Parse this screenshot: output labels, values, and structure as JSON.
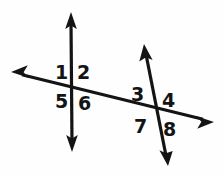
{
  "figure": {
    "name": "angle-pairs-two-transversals",
    "background_color": "#fefefe",
    "stroke_color": "#141414",
    "label_color": "#141414",
    "width": 223,
    "height": 175
  },
  "lines": [
    {
      "name": "vertical-line",
      "description": "vertical double-headed arrow line",
      "x1": 71,
      "y1": 12,
      "x2": 72,
      "y2": 152,
      "stroke_width": 3.2,
      "arrow_start": true,
      "arrow_end": true
    },
    {
      "name": "transversal-line",
      "description": "long shallow line from upper-left to lower-right",
      "x1": 11,
      "y1": 72,
      "x2": 214,
      "y2": 122,
      "stroke_width": 3.2,
      "arrow_start": true,
      "arrow_end": true
    },
    {
      "name": "slanted-line",
      "description": "steep line from upper-middle down to lower-right",
      "x1": 144,
      "y1": 44,
      "x2": 168,
      "y2": 166,
      "stroke_width": 3.2,
      "arrow_start": true,
      "arrow_end": true
    }
  ],
  "intersections": [
    {
      "name": "left-intersection",
      "x": 72,
      "y": 89
    },
    {
      "name": "right-intersection",
      "x": 156,
      "y": 112
    }
  ],
  "labels": [
    {
      "id": "1",
      "text": "1",
      "x": 55,
      "y": 63,
      "intersection": "left-intersection",
      "position": "upper-left"
    },
    {
      "id": "2",
      "text": "2",
      "x": 77,
      "y": 63,
      "intersection": "left-intersection",
      "position": "upper-right"
    },
    {
      "id": "3",
      "text": "3",
      "x": 131,
      "y": 85,
      "intersection": "right-intersection",
      "position": "upper-left"
    },
    {
      "id": "4",
      "text": "4",
      "x": 162,
      "y": 91,
      "intersection": "right-intersection",
      "position": "upper-right"
    },
    {
      "id": "5",
      "text": "5",
      "x": 55,
      "y": 92,
      "intersection": "left-intersection",
      "position": "lower-left"
    },
    {
      "id": "6",
      "text": "6",
      "x": 78,
      "y": 94,
      "intersection": "left-intersection",
      "position": "lower-right"
    },
    {
      "id": "7",
      "text": "7",
      "x": 134,
      "y": 117,
      "intersection": "right-intersection",
      "position": "lower-left"
    },
    {
      "id": "8",
      "text": "8",
      "x": 163,
      "y": 120,
      "intersection": "right-intersection",
      "position": "lower-right"
    }
  ]
}
